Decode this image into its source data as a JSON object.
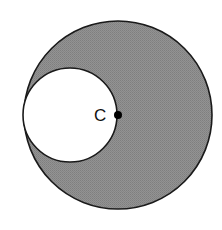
{
  "diagram": {
    "title": "",
    "background": "#ffffff",
    "shaded_color": "#8c8c8c",
    "stroke_color": "#1a1a1a",
    "large_circle": {
      "cx": 118,
      "cy": 115,
      "r": 94
    },
    "small_circle": {
      "cx": 70,
      "cy": 115,
      "r": 47,
      "fill": "#ffffff"
    },
    "point": {
      "label": "C",
      "cx": 118,
      "cy": 115,
      "r": 4,
      "color": "#000000"
    },
    "label_position": {
      "x": 94,
      "y": 121
    }
  }
}
